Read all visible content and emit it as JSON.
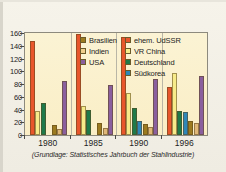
{
  "caption": "(Grundlage: Statistisches Jahrbuch der Stahlindustrie)",
  "legend": {
    "column_left": [
      {
        "label": "Brasilien",
        "color": "#9c7b20"
      },
      {
        "label": "Indien",
        "color": "#f0cf8e"
      },
      {
        "label": "USA",
        "color": "#8a5f9e"
      }
    ],
    "column_right": [
      {
        "label": "ehem. UdSSR",
        "color": "#e8562b"
      },
      {
        "label": "VR China",
        "color": "#f7eb8a"
      },
      {
        "label": "Deutschland",
        "color": "#1f7a4a"
      },
      {
        "label": "Südkorea",
        "color": "#2f87b8"
      }
    ]
  },
  "chart_data": {
    "type": "bar",
    "title": "",
    "xlabel": "",
    "ylabel": "",
    "ylim": [
      0,
      160
    ],
    "yticks": [
      0,
      20,
      40,
      60,
      80,
      100,
      120,
      140,
      160
    ],
    "grid": false,
    "legend_position": "inside-top-right",
    "categories": [
      "1980",
      "1985",
      "1990",
      "1996"
    ],
    "series": [
      {
        "name": "ehem. UdSSR",
        "color": "#e8562b",
        "values": [
          148,
          158,
          154,
          76
        ]
      },
      {
        "name": "VR China",
        "color": "#f7eb8a",
        "values": [
          37,
          46,
          66,
          98
        ]
      },
      {
        "name": "Deutschland",
        "color": "#1f7a4a",
        "values": [
          51,
          39,
          43,
          37
        ]
      },
      {
        "name": "Südkorea",
        "color": "#2f87b8",
        "values": [
          0,
          0,
          22,
          36
        ]
      },
      {
        "name": "Brasilien",
        "color": "#9c7b20",
        "values": [
          15,
          19,
          17,
          22
        ]
      },
      {
        "name": "Indien",
        "color": "#e0b878",
        "values": [
          9,
          11,
          13,
          19
        ]
      },
      {
        "name": "USA",
        "color": "#8a5f9e",
        "values": [
          84,
          78,
          88,
          92
        ]
      }
    ]
  }
}
